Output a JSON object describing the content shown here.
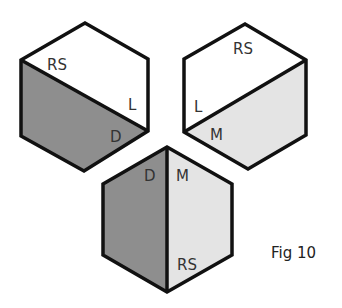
{
  "figure": {
    "caption": "Fig 10",
    "colors": {
      "stroke": "#111111",
      "white": "#ffffff",
      "dark": "#8e8e8e",
      "light": "#e4e4e4"
    },
    "cubes": [
      {
        "name": "cube-top-left",
        "labels": {
          "top": "RS",
          "right": "L",
          "bottom": "D"
        }
      },
      {
        "name": "cube-top-right",
        "labels": {
          "top": "RS",
          "left": "L",
          "bottom": "M"
        }
      },
      {
        "name": "cube-bottom",
        "labels": {
          "left": "D",
          "right": "M",
          "bottom": "RS"
        }
      }
    ]
  }
}
